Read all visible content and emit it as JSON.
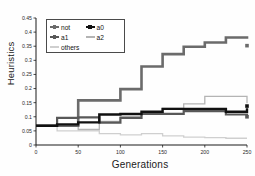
{
  "chart_data": {
    "type": "line",
    "title": "",
    "xlabel": "Generations",
    "ylabel": "Heuristics",
    "xlim": [
      0,
      250
    ],
    "ylim": [
      0,
      0.45
    ],
    "xticks": [
      0,
      50,
      100,
      150,
      200,
      250
    ],
    "yticks": [
      0,
      0.05,
      0.1,
      0.15,
      0.2,
      0.25,
      0.3,
      0.35,
      0.4,
      0.45
    ],
    "xticklabels": [
      "0",
      "50",
      "100",
      "150",
      "200",
      "250"
    ],
    "yticklabels": [
      "0",
      "0.05",
      "0.1",
      "0.15",
      "0.2",
      "0.25",
      "0.3",
      "0.35",
      "0.4",
      "0.45"
    ],
    "grid": false,
    "drawstyle": "steps-post",
    "legend_position": "upper left",
    "x": [
      0,
      25,
      50,
      75,
      100,
      125,
      150,
      175,
      200,
      225,
      250
    ],
    "series": [
      {
        "name": "not",
        "color": "#6b6b6b",
        "values": [
          0.068,
          0.068,
          0.158,
          0.158,
          0.198,
          0.278,
          0.322,
          0.348,
          0.363,
          0.381,
          0.385
        ]
      },
      {
        "name": "a0",
        "color": "#111111",
        "values": [
          0.068,
          0.073,
          0.08,
          0.108,
          0.11,
          0.118,
          0.128,
          0.128,
          0.128,
          0.118,
          0.13
        ]
      },
      {
        "name": "a1",
        "color": "#585858",
        "values": [
          0.068,
          0.096,
          0.098,
          0.079,
          0.096,
          0.11,
          0.11,
          0.12,
          0.12,
          0.108,
          0.103
        ]
      },
      {
        "name": "a2",
        "color": "#b4b4b4",
        "values": [
          0.068,
          0.068,
          0.055,
          0.084,
          0.1,
          0.112,
          0.13,
          0.146,
          0.172,
          0.172,
          0.148
        ]
      },
      {
        "name": "others",
        "color": "#cfcfcf",
        "values": [
          0.068,
          0.05,
          0.05,
          0.04,
          0.036,
          0.04,
          0.032,
          0.028,
          0.026,
          0.024,
          0.024
        ]
      }
    ],
    "endpoint_markers": [
      {
        "series": "not",
        "x": 250,
        "y": 0.352
      },
      {
        "series": "a0",
        "x": 250,
        "y": 0.138
      },
      {
        "series": "a1",
        "x": 250,
        "y": 0.1
      }
    ]
  },
  "legend": {
    "entries": [
      {
        "label": "not",
        "marker": "left-arrow-marker",
        "color": "#6b6b6b"
      },
      {
        "label": "a0",
        "marker": "left-arrow-marker",
        "color": "#111111"
      },
      {
        "label": "a1",
        "marker": "left-arrow-marker",
        "color": "#585858"
      },
      {
        "label": "a2",
        "marker": "dash-marker",
        "color": "#b4b4b4"
      },
      {
        "label": "others",
        "marker": "dash-marker",
        "color": "#cfcfcf"
      }
    ]
  },
  "axes": {
    "x_axis_title": "Generations",
    "y_axis_title": "Heuristics"
  }
}
